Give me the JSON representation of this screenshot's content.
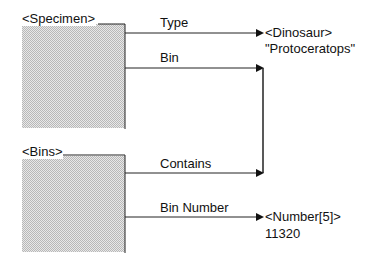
{
  "diagram": {
    "entities": [
      {
        "id": "specimen",
        "label": "<Specimen>"
      },
      {
        "id": "bins",
        "label": "<Bins>"
      }
    ],
    "relations": [
      {
        "label": "Type",
        "from": "specimen",
        "to": "dinosaur"
      },
      {
        "label": "Bin",
        "from": "specimen",
        "to": "bins"
      },
      {
        "label": "Contains",
        "from": "bins",
        "to": "bins"
      },
      {
        "label": "Bin Number",
        "from": "bins",
        "to": "number"
      }
    ],
    "targets": [
      {
        "id": "dinosaur",
        "type": "<Dinosaur>",
        "value": "\"Protoceratops\""
      },
      {
        "id": "number",
        "type": "<Number[5]>",
        "value": "11320"
      }
    ]
  }
}
